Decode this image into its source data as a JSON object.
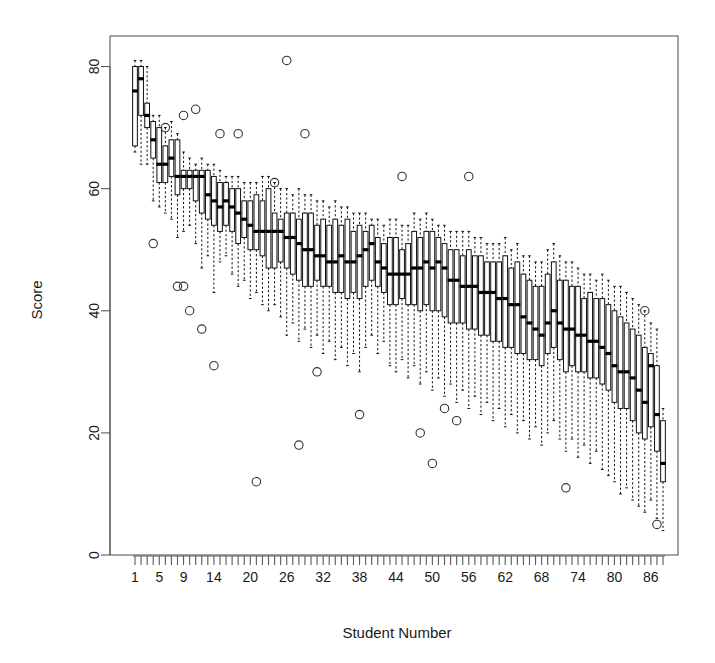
{
  "chart_data": {
    "type": "box",
    "title": "",
    "xlabel": "Student Number",
    "ylabel": "Score",
    "ylim": [
      0,
      85
    ],
    "yticks": [
      0,
      20,
      40,
      60,
      80
    ],
    "xticks_labeled": [
      1,
      5,
      9,
      14,
      20,
      26,
      32,
      38,
      44,
      50,
      56,
      62,
      68,
      74,
      80,
      86
    ],
    "n_boxes": 88,
    "grid": false,
    "legend": "none",
    "box_fill": "#ffffff",
    "line_color": "#111111",
    "median_color": "#000000",
    "outlier_marker": "open-circle",
    "whisker_style": "dashed",
    "boxes": [
      {
        "x": 1,
        "whisker_low": 66,
        "q1": 67,
        "median": 76,
        "q3": 80,
        "whisker_high": 81,
        "outliers": []
      },
      {
        "x": 2,
        "whisker_low": 64,
        "q1": 72,
        "median": 78,
        "q3": 80,
        "whisker_high": 81,
        "outliers": []
      },
      {
        "x": 3,
        "whisker_low": 64,
        "q1": 70,
        "median": 72,
        "q3": 74,
        "whisker_high": 80,
        "outliers": []
      },
      {
        "x": 4,
        "whisker_low": 58,
        "q1": 65,
        "median": 68,
        "q3": 71,
        "whisker_high": 72,
        "outliers": [
          51
        ]
      },
      {
        "x": 5,
        "whisker_low": 57,
        "q1": 61,
        "median": 64,
        "q3": 70,
        "whisker_high": 72,
        "outliers": []
      },
      {
        "x": 6,
        "whisker_low": 56,
        "q1": 61,
        "median": 64,
        "q3": 67,
        "whisker_high": 70,
        "outliers": [
          70
        ]
      },
      {
        "x": 7,
        "whisker_low": 55,
        "q1": 62,
        "median": 65,
        "q3": 68,
        "whisker_high": 71,
        "outliers": []
      },
      {
        "x": 8,
        "whisker_low": 52,
        "q1": 59,
        "median": 62,
        "q3": 68,
        "whisker_high": 69,
        "outliers": [
          44
        ]
      },
      {
        "x": 9,
        "whisker_low": 53,
        "q1": 60,
        "median": 62,
        "q3": 63,
        "whisker_high": 66,
        "outliers": [
          72,
          44
        ]
      },
      {
        "x": 10,
        "whisker_low": 54,
        "q1": 60,
        "median": 62,
        "q3": 63,
        "whisker_high": 65,
        "outliers": [
          40
        ]
      },
      {
        "x": 11,
        "whisker_low": 51,
        "q1": 58,
        "median": 62,
        "q3": 63,
        "whisker_high": 64,
        "outliers": [
          73
        ]
      },
      {
        "x": 12,
        "whisker_low": 47,
        "q1": 56,
        "median": 62,
        "q3": 63,
        "whisker_high": 65,
        "outliers": [
          37
        ]
      },
      {
        "x": 13,
        "whisker_low": 49,
        "q1": 55,
        "median": 59,
        "q3": 63,
        "whisker_high": 64,
        "outliers": []
      },
      {
        "x": 14,
        "whisker_low": 43,
        "q1": 54,
        "median": 58,
        "q3": 62,
        "whisker_high": 64,
        "outliers": [
          31
        ]
      },
      {
        "x": 15,
        "whisker_low": 48,
        "q1": 53,
        "median": 57,
        "q3": 61,
        "whisker_high": 63,
        "outliers": [
          69
        ]
      },
      {
        "x": 16,
        "whisker_low": 49,
        "q1": 54,
        "median": 58,
        "q3": 61,
        "whisker_high": 62,
        "outliers": []
      },
      {
        "x": 17,
        "whisker_low": 46,
        "q1": 53,
        "median": 57,
        "q3": 60,
        "whisker_high": 62,
        "outliers": []
      },
      {
        "x": 18,
        "whisker_low": 44,
        "q1": 51,
        "median": 56,
        "q3": 60,
        "whisker_high": 62,
        "outliers": [
          69
        ]
      },
      {
        "x": 19,
        "whisker_low": 45,
        "q1": 52,
        "median": 55,
        "q3": 58,
        "whisker_high": 61,
        "outliers": []
      },
      {
        "x": 20,
        "whisker_low": 42,
        "q1": 50,
        "median": 54,
        "q3": 58,
        "whisker_high": 61,
        "outliers": []
      },
      {
        "x": 21,
        "whisker_low": 43,
        "q1": 50,
        "median": 53,
        "q3": 59,
        "whisker_high": 61,
        "outliers": [
          12
        ]
      },
      {
        "x": 22,
        "whisker_low": 41,
        "q1": 49,
        "median": 53,
        "q3": 58,
        "whisker_high": 62,
        "outliers": []
      },
      {
        "x": 23,
        "whisker_low": 40,
        "q1": 47,
        "median": 53,
        "q3": 60,
        "whisker_high": 62,
        "outliers": []
      },
      {
        "x": 24,
        "whisker_low": 41,
        "q1": 47,
        "median": 53,
        "q3": 56,
        "whisker_high": 61,
        "outliers": [
          61
        ]
      },
      {
        "x": 25,
        "whisker_low": 39,
        "q1": 48,
        "median": 53,
        "q3": 55,
        "whisker_high": 60,
        "outliers": []
      },
      {
        "x": 26,
        "whisker_low": 36,
        "q1": 47,
        "median": 52,
        "q3": 56,
        "whisker_high": 60,
        "outliers": [
          81
        ]
      },
      {
        "x": 27,
        "whisker_low": 38,
        "q1": 46,
        "median": 52,
        "q3": 56,
        "whisker_high": 59,
        "outliers": []
      },
      {
        "x": 28,
        "whisker_low": 35,
        "q1": 45,
        "median": 51,
        "q3": 55,
        "whisker_high": 60,
        "outliers": [
          18
        ]
      },
      {
        "x": 29,
        "whisker_low": 37,
        "q1": 44,
        "median": 50,
        "q3": 56,
        "whisker_high": 59,
        "outliers": [
          69
        ]
      },
      {
        "x": 30,
        "whisker_low": 34,
        "q1": 44,
        "median": 50,
        "q3": 56,
        "whisker_high": 59,
        "outliers": []
      },
      {
        "x": 31,
        "whisker_low": 36,
        "q1": 45,
        "median": 49,
        "q3": 54,
        "whisker_high": 58,
        "outliers": [
          30
        ]
      },
      {
        "x": 32,
        "whisker_low": 33,
        "q1": 44,
        "median": 49,
        "q3": 55,
        "whisker_high": 58,
        "outliers": []
      },
      {
        "x": 33,
        "whisker_low": 35,
        "q1": 44,
        "median": 48,
        "q3": 54,
        "whisker_high": 57,
        "outliers": []
      },
      {
        "x": 34,
        "whisker_low": 32,
        "q1": 43,
        "median": 48,
        "q3": 55,
        "whisker_high": 58,
        "outliers": []
      },
      {
        "x": 35,
        "whisker_low": 34,
        "q1": 43,
        "median": 49,
        "q3": 54,
        "whisker_high": 57,
        "outliers": []
      },
      {
        "x": 36,
        "whisker_low": 31,
        "q1": 42,
        "median": 48,
        "q3": 55,
        "whisker_high": 57,
        "outliers": []
      },
      {
        "x": 37,
        "whisker_low": 33,
        "q1": 43,
        "median": 48,
        "q3": 53,
        "whisker_high": 56,
        "outliers": []
      },
      {
        "x": 38,
        "whisker_low": 30,
        "q1": 42,
        "median": 49,
        "q3": 54,
        "whisker_high": 56,
        "outliers": [
          23
        ]
      },
      {
        "x": 39,
        "whisker_low": 34,
        "q1": 44,
        "median": 50,
        "q3": 53,
        "whisker_high": 56,
        "outliers": []
      },
      {
        "x": 40,
        "whisker_low": 36,
        "q1": 45,
        "median": 51,
        "q3": 54,
        "whisker_high": 55,
        "outliers": []
      },
      {
        "x": 41,
        "whisker_low": 33,
        "q1": 44,
        "median": 48,
        "q3": 52,
        "whisker_high": 55,
        "outliers": []
      },
      {
        "x": 42,
        "whisker_low": 35,
        "q1": 43,
        "median": 47,
        "q3": 51,
        "whisker_high": 54,
        "outliers": []
      },
      {
        "x": 43,
        "whisker_low": 31,
        "q1": 41,
        "median": 46,
        "q3": 52,
        "whisker_high": 55,
        "outliers": []
      },
      {
        "x": 44,
        "whisker_low": 30,
        "q1": 41,
        "median": 46,
        "q3": 52,
        "whisker_high": 55,
        "outliers": []
      },
      {
        "x": 45,
        "whisker_low": 32,
        "q1": 42,
        "median": 46,
        "q3": 50,
        "whisker_high": 54,
        "outliers": [
          62
        ]
      },
      {
        "x": 46,
        "whisker_low": 29,
        "q1": 41,
        "median": 46,
        "q3": 51,
        "whisker_high": 54,
        "outliers": []
      },
      {
        "x": 47,
        "whisker_low": 31,
        "q1": 41,
        "median": 47,
        "q3": 53,
        "whisker_high": 56,
        "outliers": []
      },
      {
        "x": 48,
        "whisker_low": 28,
        "q1": 40,
        "median": 47,
        "q3": 52,
        "whisker_high": 55,
        "outliers": [
          20
        ]
      },
      {
        "x": 49,
        "whisker_low": 30,
        "q1": 41,
        "median": 48,
        "q3": 53,
        "whisker_high": 56,
        "outliers": []
      },
      {
        "x": 50,
        "whisker_low": 27,
        "q1": 40,
        "median": 47,
        "q3": 53,
        "whisker_high": 55,
        "outliers": [
          15
        ]
      },
      {
        "x": 51,
        "whisker_low": 29,
        "q1": 40,
        "median": 48,
        "q3": 52,
        "whisker_high": 54,
        "outliers": []
      },
      {
        "x": 52,
        "whisker_low": 26,
        "q1": 39,
        "median": 47,
        "q3": 51,
        "whisker_high": 54,
        "outliers": [
          24
        ]
      },
      {
        "x": 53,
        "whisker_low": 28,
        "q1": 38,
        "median": 45,
        "q3": 50,
        "whisker_high": 53,
        "outliers": []
      },
      {
        "x": 54,
        "whisker_low": 25,
        "q1": 38,
        "median": 45,
        "q3": 50,
        "whisker_high": 53,
        "outliers": [
          22
        ]
      },
      {
        "x": 55,
        "whisker_low": 27,
        "q1": 38,
        "median": 44,
        "q3": 49,
        "whisker_high": 53,
        "outliers": []
      },
      {
        "x": 56,
        "whisker_low": 24,
        "q1": 37,
        "median": 44,
        "q3": 50,
        "whisker_high": 53,
        "outliers": [
          62
        ]
      },
      {
        "x": 57,
        "whisker_low": 26,
        "q1": 37,
        "median": 44,
        "q3": 49,
        "whisker_high": 52,
        "outliers": []
      },
      {
        "x": 58,
        "whisker_low": 23,
        "q1": 36,
        "median": 43,
        "q3": 49,
        "whisker_high": 52,
        "outliers": []
      },
      {
        "x": 59,
        "whisker_low": 25,
        "q1": 36,
        "median": 43,
        "q3": 48,
        "whisker_high": 51,
        "outliers": []
      },
      {
        "x": 60,
        "whisker_low": 22,
        "q1": 35,
        "median": 43,
        "q3": 48,
        "whisker_high": 51,
        "outliers": []
      },
      {
        "x": 61,
        "whisker_low": 24,
        "q1": 35,
        "median": 42,
        "q3": 48,
        "whisker_high": 51,
        "outliers": []
      },
      {
        "x": 62,
        "whisker_low": 21,
        "q1": 34,
        "median": 42,
        "q3": 49,
        "whisker_high": 52,
        "outliers": []
      },
      {
        "x": 63,
        "whisker_low": 23,
        "q1": 34,
        "median": 41,
        "q3": 47,
        "whisker_high": 50,
        "outliers": []
      },
      {
        "x": 64,
        "whisker_low": 20,
        "q1": 33,
        "median": 41,
        "q3": 48,
        "whisker_high": 51,
        "outliers": []
      },
      {
        "x": 65,
        "whisker_low": 22,
        "q1": 33,
        "median": 39,
        "q3": 46,
        "whisker_high": 49,
        "outliers": []
      },
      {
        "x": 66,
        "whisker_low": 19,
        "q1": 32,
        "median": 38,
        "q3": 45,
        "whisker_high": 49,
        "outliers": []
      },
      {
        "x": 67,
        "whisker_low": 21,
        "q1": 32,
        "median": 37,
        "q3": 44,
        "whisker_high": 48,
        "outliers": []
      },
      {
        "x": 68,
        "whisker_low": 18,
        "q1": 31,
        "median": 36,
        "q3": 44,
        "whisker_high": 48,
        "outliers": []
      },
      {
        "x": 69,
        "whisker_low": 20,
        "q1": 33,
        "median": 38,
        "q3": 46,
        "whisker_high": 50,
        "outliers": []
      },
      {
        "x": 70,
        "whisker_low": 22,
        "q1": 34,
        "median": 40,
        "q3": 48,
        "whisker_high": 51,
        "outliers": []
      },
      {
        "x": 71,
        "whisker_low": 19,
        "q1": 32,
        "median": 38,
        "q3": 45,
        "whisker_high": 49,
        "outliers": []
      },
      {
        "x": 72,
        "whisker_low": 17,
        "q1": 30,
        "median": 37,
        "q3": 45,
        "whisker_high": 48,
        "outliers": [
          11
        ]
      },
      {
        "x": 73,
        "whisker_low": 19,
        "q1": 31,
        "median": 37,
        "q3": 44,
        "whisker_high": 48,
        "outliers": []
      },
      {
        "x": 74,
        "whisker_low": 16,
        "q1": 30,
        "median": 36,
        "q3": 44,
        "whisker_high": 47,
        "outliers": []
      },
      {
        "x": 75,
        "whisker_low": 18,
        "q1": 30,
        "median": 36,
        "q3": 42,
        "whisker_high": 46,
        "outliers": []
      },
      {
        "x": 76,
        "whisker_low": 15,
        "q1": 29,
        "median": 35,
        "q3": 43,
        "whisker_high": 46,
        "outliers": []
      },
      {
        "x": 77,
        "whisker_low": 17,
        "q1": 29,
        "median": 35,
        "q3": 42,
        "whisker_high": 45,
        "outliers": []
      },
      {
        "x": 78,
        "whisker_low": 14,
        "q1": 28,
        "median": 34,
        "q3": 42,
        "whisker_high": 46,
        "outliers": []
      },
      {
        "x": 79,
        "whisker_low": 13,
        "q1": 27,
        "median": 33,
        "q3": 41,
        "whisker_high": 45,
        "outliers": []
      },
      {
        "x": 80,
        "whisker_low": 12,
        "q1": 25,
        "median": 31,
        "q3": 40,
        "whisker_high": 44,
        "outliers": []
      },
      {
        "x": 81,
        "whisker_low": 10,
        "q1": 24,
        "median": 30,
        "q3": 39,
        "whisker_high": 44,
        "outliers": []
      },
      {
        "x": 82,
        "whisker_low": 11,
        "q1": 24,
        "median": 30,
        "q3": 38,
        "whisker_high": 43,
        "outliers": []
      },
      {
        "x": 83,
        "whisker_low": 9,
        "q1": 22,
        "median": 29,
        "q3": 37,
        "whisker_high": 42,
        "outliers": []
      },
      {
        "x": 84,
        "whisker_low": 8,
        "q1": 20,
        "median": 27,
        "q3": 36,
        "whisker_high": 41,
        "outliers": []
      },
      {
        "x": 85,
        "whisker_low": 7,
        "q1": 19,
        "median": 25,
        "q3": 34,
        "whisker_high": 40,
        "outliers": [
          40
        ]
      },
      {
        "x": 86,
        "whisker_low": 9,
        "q1": 21,
        "median": 31,
        "q3": 33,
        "whisker_high": 38,
        "outliers": []
      },
      {
        "x": 87,
        "whisker_low": 6,
        "q1": 17,
        "median": 23,
        "q3": 31,
        "whisker_high": 37,
        "outliers": [
          5
        ]
      },
      {
        "x": 88,
        "whisker_low": 4,
        "q1": 12,
        "median": 15,
        "q3": 22,
        "whisker_high": 24,
        "outliers": []
      }
    ]
  }
}
